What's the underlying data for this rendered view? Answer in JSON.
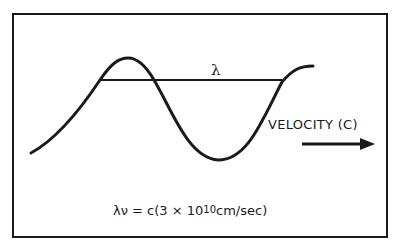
{
  "diagram": {
    "type": "wave-diagram",
    "wavelength_symbol": "λ",
    "velocity_label": "VELOCITY (C)",
    "equation": {
      "lhs": "λν = c(3 × 10",
      "exponent": "10",
      "rhs": "cm/sec)"
    },
    "icons": {
      "direction_arrow": "arrow-right-icon"
    },
    "colors": {
      "stroke": "#1a1a1a",
      "background": "#ffffff"
    }
  }
}
